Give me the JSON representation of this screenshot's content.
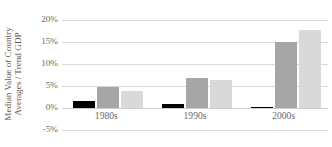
{
  "chart_data": {
    "type": "bar",
    "title": "",
    "subtitle": "",
    "xlabel": "",
    "ylabel": "Median Value of Country Averages / Trend GDP",
    "ylabel_lines": [
      "Median Value of Country",
      "Averages / Trend GDP"
    ],
    "categories": [
      "1980s",
      "1990s",
      "2000s"
    ],
    "series": [
      {
        "name": "series-1",
        "color": "#000000",
        "values": [
          1.5,
          0.8,
          0.1
        ]
      },
      {
        "name": "series-2",
        "color": "#a6a6a6",
        "values": [
          4.8,
          6.9,
          15.1
        ]
      },
      {
        "name": "series-3",
        "color": "#d9d9d9",
        "values": [
          3.8,
          6.4,
          17.7
        ]
      }
    ],
    "ylim": [
      -5,
      20
    ],
    "yticks": [
      20,
      15,
      10,
      5,
      0,
      -5
    ],
    "ytick_labels": [
      "20%",
      "15%",
      "10%",
      "5%",
      "0%",
      "-5%"
    ],
    "grid": true,
    "grid_axis": "y",
    "legend": false,
    "legend_position": "none",
    "value_unit": "%",
    "gridline_color": "#d9d9d9",
    "background_color": "#ffffff",
    "text_color": "#595959"
  }
}
